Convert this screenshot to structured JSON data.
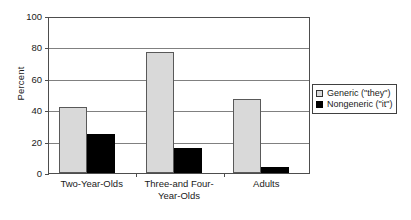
{
  "chart_data": {
    "type": "bar",
    "title": "",
    "subtitle": "",
    "xlabel": "",
    "ylabel": "Percent",
    "ylim": [
      0,
      100
    ],
    "yticks": [
      0,
      20,
      40,
      60,
      80,
      100
    ],
    "grid": true,
    "legend_position": "right",
    "categories": [
      "Two-Year-Olds",
      "Three-and Four-Year-Olds",
      "Adults"
    ],
    "category_lines": [
      [
        "Two-Year-Olds"
      ],
      [
        "Three-and Four-",
        "Year-Olds"
      ],
      [
        "Adults"
      ]
    ],
    "series": [
      {
        "name": "Generic (\"they\")",
        "color": "#d9d9d9",
        "values": [
          42,
          77,
          47
        ]
      },
      {
        "name": "Nongeneric (\"it\")",
        "color": "#000000",
        "values": [
          25,
          16,
          4
        ]
      }
    ]
  },
  "legend": {
    "items": [
      {
        "label": "Generic (\"they\")",
        "swatch": "legend-swatch-generic"
      },
      {
        "label": "Nongeneric (\"it\")",
        "swatch": "legend-swatch-nongeneric"
      }
    ]
  },
  "axis": {
    "y_title": "Percent",
    "y_tick_labels": [
      "100",
      "80",
      "60",
      "40",
      "20",
      "0"
    ]
  }
}
